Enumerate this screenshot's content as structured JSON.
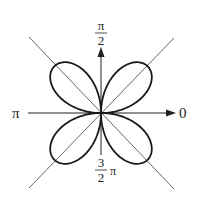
{
  "chart_data": {
    "type": "polar_line",
    "title": "",
    "equation_form": "r = a sin(2θ)",
    "petals": 4,
    "curve": {
      "a": 1,
      "theta_range": [
        0,
        6.2832
      ],
      "samples": 360
    },
    "axis_labels": {
      "right": "0",
      "top_num": "π",
      "top_den": "2",
      "left": "π",
      "bottom_num": "3",
      "bottom_den": "2",
      "bottom_suffix": "π"
    },
    "reference_lines": [
      "θ = π/4",
      "θ = 3π/4"
    ],
    "grid": false
  },
  "colors": {
    "curve": "#1a1a1a",
    "axis": "#222222",
    "diagonal": "#555555",
    "background": "#ffffff"
  }
}
